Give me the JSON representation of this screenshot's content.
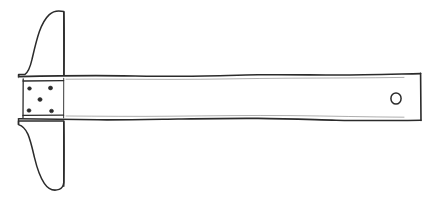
{
  "figure": {
    "subject": "t-square",
    "style": "hand-drawn engraving line art",
    "background_color": "#ffffff",
    "ink_color": "#2b2b2b",
    "canvas": {
      "width": 438,
      "height": 199
    },
    "title": "T-square",
    "caption": "",
    "parts": [
      {
        "id": "head",
        "label": "Stock (head)",
        "description": "Tall vertical member at the left with rounded top tip, concave tapered sides and a narrow pointed bottom tip.",
        "top_y": 11,
        "bottom_y": 190,
        "inner_edge_x": 64,
        "max_left_x": 17,
        "interactable": false
      },
      {
        "id": "blade",
        "label": "Blade (tongue)",
        "description": "Long horizontal straight-edge extending right from the head, with slightly wavy hand-drawn top and bottom edges and a squared right end.",
        "left_x": 18,
        "right_x": 421,
        "top_y": 74,
        "bottom_y": 120,
        "interactable": false
      },
      {
        "id": "joint-plate",
        "label": "Riveted joint plate",
        "description": "Rectangular reinforcing plate where the blade meets the head.",
        "left_x": 23,
        "right_x": 64,
        "top_y": 78,
        "bottom_y": 118,
        "interactable": false
      },
      {
        "id": "hanging-hole",
        "label": "Hanging hole",
        "description": "Small circular hole near the right end of the blade for hanging the tool.",
        "center_x": 396,
        "center_y": 98,
        "radius": 5,
        "interactable": false
      }
    ],
    "rivets": {
      "label": "Rivets",
      "count": 5,
      "pattern": "quincunx",
      "positions": [
        {
          "cx": 29.5,
          "cy": 88.5,
          "r": 1.9
        },
        {
          "cx": 50.5,
          "cy": 88.0,
          "r": 2.1
        },
        {
          "cx": 40.0,
          "cy": 99.5,
          "r": 2.1
        },
        {
          "cx": 29.0,
          "cy": 110.5,
          "r": 2.0
        },
        {
          "cx": 51.5,
          "cy": 111.0,
          "r": 2.0
        }
      ]
    },
    "measurements": {
      "blade_length_px": 403,
      "blade_thickness_px": 46,
      "head_height_px": 179
    }
  }
}
